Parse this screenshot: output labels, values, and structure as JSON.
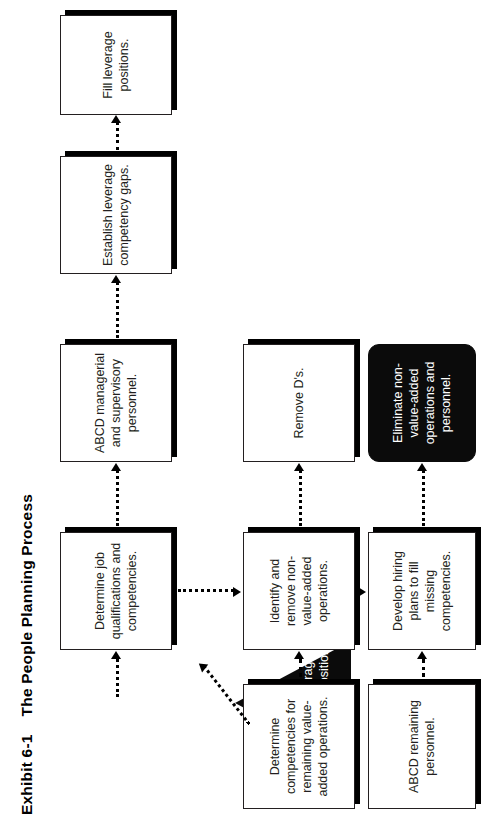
{
  "exhibit": {
    "number": "Exhibit 6-1",
    "title": "The People Planning Process",
    "heading": "Exhibit 6-1    The People Planning Process"
  },
  "diagram": {
    "type": "flowchart",
    "orientation": "rotated-90-ccw",
    "start_shape": {
      "shape": "triangle",
      "fill": "#0b0b0b",
      "text_color": "#ffffff",
      "label": "Pinpoint leverage management positions."
    },
    "annotation": {
      "line1": "LINKAGE:",
      "line2": "COMPETITIVE",
      "line3": "STRATEGY"
    },
    "nodes": [
      {
        "id": "n1",
        "row": "top",
        "col": 1,
        "label": "Determine job qualifications and competencies.",
        "style": "white-shadow"
      },
      {
        "id": "n2",
        "row": "top",
        "col": 2,
        "label": "ABCD managerial and supervisory personnel.",
        "style": "white-shadow"
      },
      {
        "id": "n3",
        "row": "top",
        "col": 3,
        "label": "Establish leverage competency gaps.",
        "style": "white-shadow"
      },
      {
        "id": "n4",
        "row": "top",
        "col": 4,
        "label": "Fill leverage positions.",
        "style": "white-shadow"
      },
      {
        "id": "n5",
        "row": "middle",
        "col": 0,
        "label": "Determine competencies for remaining value-added operations.",
        "style": "white-shadow"
      },
      {
        "id": "n6",
        "row": "middle",
        "col": 1,
        "label": "Identify and remove non-value-added operations.",
        "style": "white-shadow"
      },
      {
        "id": "n7",
        "row": "middle",
        "col": 2,
        "label": "Remove D's.",
        "style": "white-shadow"
      },
      {
        "id": "n8",
        "row": "bottom",
        "col": 0,
        "label": "ABCD remaining personnel.",
        "style": "white-shadow"
      },
      {
        "id": "n9",
        "row": "bottom",
        "col": 1,
        "label": "Develop hiring plans to fill missing competencies.",
        "style": "white-shadow"
      },
      {
        "id": "n10",
        "row": "bottom",
        "col": 2,
        "label": "Eliminate non-value-added operations and personnel.",
        "style": "black-rounded"
      }
    ],
    "connectors": [
      {
        "from": "start",
        "to": "n1",
        "style": "dotted",
        "arrow": "end"
      },
      {
        "from": "n1",
        "to": "n2",
        "style": "dotted",
        "arrow": "end"
      },
      {
        "from": "n2",
        "to": "n3",
        "style": "dotted",
        "arrow": "end"
      },
      {
        "from": "n3",
        "to": "n4",
        "style": "dotted",
        "arrow": "end"
      },
      {
        "from": "n5",
        "to": "n6",
        "style": "dotted",
        "arrow": "end"
      },
      {
        "from": "n6",
        "to": "n7",
        "style": "dotted",
        "arrow": "end"
      },
      {
        "from": "n8",
        "to": "n9",
        "style": "dotted",
        "arrow": "end"
      },
      {
        "from": "n9",
        "to": "n10",
        "style": "dotted",
        "arrow": "end"
      },
      {
        "from": "n1",
        "to": "n6",
        "style": "dotted",
        "arrow": "end"
      },
      {
        "from": "n6",
        "to": "n9",
        "style": "dotted",
        "arrow": "end"
      },
      {
        "from": "n5",
        "to": "start",
        "style": "dotted-diagonal",
        "arrow": "end"
      }
    ],
    "colors": {
      "line": "#000000",
      "node_fill": "#ffffff",
      "node_border": "#231f20",
      "dark_fill": "#0b0b0b",
      "dark_text": "#ffffff",
      "text": "#231f20"
    }
  }
}
